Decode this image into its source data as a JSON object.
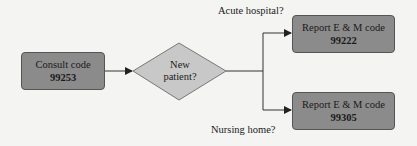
{
  "diagram": {
    "type": "flowchart",
    "nodes": {
      "consult": {
        "line1": "Consult code",
        "code": "99253"
      },
      "decision": {
        "line1": "New",
        "line2": "patient?"
      },
      "acute": {
        "line1": "Report E & M code",
        "code": "99222"
      },
      "nursing": {
        "line1": "Report E & M code",
        "code": "99305"
      }
    },
    "edge_labels": {
      "acute": "Acute hospital?",
      "nursing": "Nursing home?"
    },
    "colors": {
      "box_fill": "#8b8b8b",
      "diamond_fill": "#c8c8c8",
      "stroke": "#444444",
      "background": "#f4f4f2"
    }
  }
}
